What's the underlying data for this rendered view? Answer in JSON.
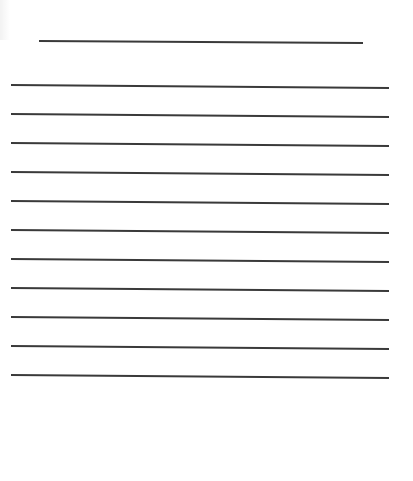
{
  "document": {
    "type": "blank lined writing sheet",
    "title_line": {
      "x_start": 39,
      "x_end": 363,
      "y": 41
    },
    "writing_lines": {
      "count": 11,
      "x_start": 11,
      "x_end": 389,
      "y_positions": [
        85,
        114,
        143,
        172,
        201,
        230,
        259,
        288,
        317,
        346,
        375
      ]
    },
    "colors": {
      "background": "#ffffff",
      "line": "#3a3a3a"
    }
  }
}
